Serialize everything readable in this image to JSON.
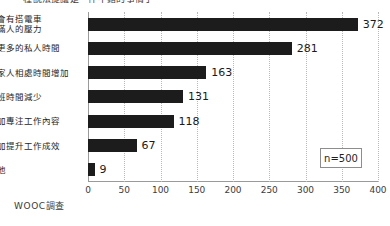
{
  "title_sliver": "一種說法提議是一件不錯的事情了",
  "source_note": "WOOC調查",
  "sample_note": "n=500",
  "chart_data": {
    "type": "bar",
    "orientation": "horizontal",
    "title": "",
    "xlabel": "",
    "ylabel": "",
    "xlim": [
      0,
      400
    ],
    "xticks": [
      0,
      50,
      100,
      150,
      200,
      250,
      300,
      350,
      400
    ],
    "grid": true,
    "legend": "none",
    "bar_color": "#1c1c1c",
    "categories": [
      "不會有搭電車\n擠滿人的壓力",
      "有更多的私人時間",
      "與家人相處時間增加",
      "加班時間減少",
      "更加專注工作內容",
      "更加提升工作成效",
      "其他"
    ],
    "values": [
      372,
      281,
      163,
      131,
      118,
      67,
      9
    ],
    "annotations": [
      "n=500"
    ]
  }
}
